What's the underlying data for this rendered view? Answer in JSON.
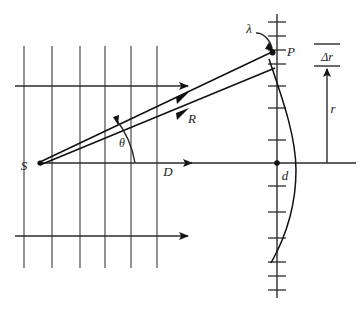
{
  "figure": {
    "type": "optics-geometry-diagram",
    "background_color": "#ffffff",
    "ink_color": "#111111",
    "grid_color": "#3a3a3a"
  },
  "labels": {
    "source_point": "S",
    "observation_point": "P",
    "wavelength": "λ",
    "ray_distance": "R",
    "axis_distance": "D",
    "angle": "θ",
    "aperture_point": "d",
    "radius": "r",
    "path_difference": "Δr"
  },
  "points": {
    "S": {
      "x": 38,
      "y": 163
    },
    "P": {
      "x": 272,
      "y": 52
    },
    "d": {
      "x": 277,
      "y": 163
    }
  },
  "grid": {
    "wavefront_lines_x": [
      24,
      52,
      80,
      105,
      131,
      157
    ],
    "wavefront_top_y": 46,
    "wavefront_bottom_y": 268,
    "ray_arrow_rows_y": [
      86,
      163,
      236
    ]
  },
  "screen": {
    "axis_x": 277,
    "axis_top_y": 14,
    "axis_bottom_y": 298,
    "tick_half_width": 9,
    "ticks_y": [
      22,
      36,
      50,
      64,
      86,
      108,
      140,
      186,
      212,
      238,
      262,
      276,
      290
    ]
  },
  "delta_r_scale": {
    "arrow_x": 327,
    "arrow_top_y": 72,
    "arrow_bottom_y": 163,
    "bar_top_y": 44,
    "bar_mid_y": 66,
    "bar_half_width": 13
  },
  "right_axis": {
    "horizontal_y": 163,
    "x_start": 277,
    "x_end": 356
  }
}
